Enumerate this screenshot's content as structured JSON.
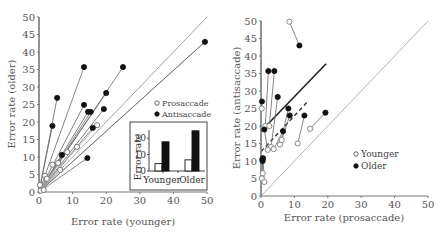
{
  "chart_data": [
    {
      "type": "scatter",
      "title": "",
      "xlabel": "Error rate (younger)",
      "ylabel": "Error rate (older)",
      "xlim": [
        0,
        50
      ],
      "ylim": [
        0,
        50
      ],
      "xticks": [
        "0",
        "10",
        "20",
        "30",
        "40",
        "50"
      ],
      "yticks": [
        "0",
        "5",
        "10",
        "15",
        "20",
        "25",
        "30",
        "35",
        "40",
        "45",
        "50"
      ],
      "grid": false,
      "legend": {
        "placement": "right-middle",
        "entries": [
          "Prosaccade",
          "Antisaccade"
        ]
      },
      "series": [
        {
          "name": "Prosaccade",
          "marker": "open-circle",
          "points": [
            {
              "x": 17.3,
              "y": 19.1
            },
            {
              "x": 11.3,
              "y": 12.9
            },
            {
              "x": 8.4,
              "y": 11.4
            },
            {
              "x": 5.7,
              "y": 8.3
            },
            {
              "x": 4.0,
              "y": 7.8
            },
            {
              "x": 6.3,
              "y": 6.3
            },
            {
              "x": 1.8,
              "y": 4.6
            },
            {
              "x": 2.3,
              "y": 3.8
            },
            {
              "x": 0.3,
              "y": 2.0
            },
            {
              "x": 0.5,
              "y": 0.4
            },
            {
              "x": 1.4,
              "y": 0.6
            }
          ]
        },
        {
          "name": "Antisaccade",
          "marker": "filled-circle",
          "points": [
            {
              "x": 5.4,
              "y": 26.9
            },
            {
              "x": 13.4,
              "y": 35.7
            },
            {
              "x": 25.0,
              "y": 35.7
            },
            {
              "x": 20.0,
              "y": 28.3
            },
            {
              "x": 13.4,
              "y": 24.9
            },
            {
              "x": 14.6,
              "y": 22.9
            },
            {
              "x": 15.4,
              "y": 22.9
            },
            {
              "x": 19.3,
              "y": 23.7
            },
            {
              "x": 49.4,
              "y": 42.9
            },
            {
              "x": 4.0,
              "y": 18.9
            },
            {
              "x": 16.0,
              "y": 18.3
            },
            {
              "x": 6.8,
              "y": 10.6
            },
            {
              "x": 14.4,
              "y": 9.7
            }
          ]
        }
      ],
      "rays_from_origin_to_antisaccade": true,
      "reference_lines": [
        {
          "name": "identity",
          "from": [
            0,
            0
          ],
          "to": [
            50,
            50
          ]
        },
        {
          "name": "fit",
          "from": [
            0,
            0
          ],
          "to": [
            49.4,
            42.9
          ]
        }
      ],
      "inset": {
        "type": "bar",
        "ylabel": "Error rate",
        "categories": [
          "Younger",
          "Older"
        ],
        "yticks": [
          "0",
          "10",
          "20"
        ],
        "ylim": [
          0,
          25
        ],
        "series": [
          {
            "name": "Prosaccade",
            "fill": "#ffffff",
            "values": [
              4.5,
              6.8
            ]
          },
          {
            "name": "Antisaccade",
            "fill": "#111111",
            "values": [
              17.8,
              24.5
            ]
          }
        ]
      }
    },
    {
      "type": "scatter",
      "title": "",
      "xlabel": "Error rate (prosaccade)",
      "ylabel": "Error rate (antisaccade)",
      "xlim": [
        0,
        50
      ],
      "ylim": [
        0,
        50
      ],
      "xticks": [
        "0",
        "10",
        "20",
        "30",
        "40",
        "50"
      ],
      "yticks": [
        "0",
        "5",
        "10",
        "15",
        "20",
        "25",
        "30",
        "35",
        "40",
        "45",
        "50"
      ],
      "grid": false,
      "legend": {
        "placement": "right-middle",
        "entries": [
          "Younger",
          "Older"
        ]
      },
      "pairs": [
        {
          "younger": {
            "x": 8.5,
            "y": 49.8
          },
          "older": {
            "x": 11.5,
            "y": 43.0
          }
        },
        {
          "younger": {
            "x": 0.2,
            "y": 25.0
          },
          "older": {
            "x": 0.3,
            "y": 27.0
          }
        },
        {
          "younger": {
            "x": 1.3,
            "y": 20.0
          },
          "older": {
            "x": 2.2,
            "y": 35.7
          }
        },
        {
          "younger": {
            "x": 2.5,
            "y": 20.0
          },
          "older": {
            "x": 4.0,
            "y": 35.7
          }
        },
        {
          "younger": {
            "x": 3.0,
            "y": 14.0
          },
          "older": {
            "x": 5.0,
            "y": 28.3
          }
        },
        {
          "younger": {
            "x": 5.7,
            "y": 14.7
          },
          "older": {
            "x": 8.2,
            "y": 25.0
          }
        },
        {
          "younger": {
            "x": 6.2,
            "y": 16.0
          },
          "older": {
            "x": 8.6,
            "y": 23.0
          }
        },
        {
          "younger": {
            "x": 11.0,
            "y": 15.0
          },
          "older": {
            "x": 13.0,
            "y": 23.0
          }
        },
        {
          "younger": {
            "x": 14.7,
            "y": 19.2
          },
          "older": {
            "x": 19.3,
            "y": 23.8
          }
        },
        {
          "younger": {
            "x": 3.8,
            "y": 13.4
          },
          "older": {
            "x": 6.6,
            "y": 18.5
          }
        },
        {
          "younger": {
            "x": 2.0,
            "y": 13.2
          },
          "older": {
            "x": 1.0,
            "y": 19.0
          }
        },
        {
          "younger": {
            "x": 0.5,
            "y": 6.5
          },
          "older": {
            "x": 0.4,
            "y": 10.5
          }
        },
        {
          "younger": {
            "x": 0.2,
            "y": 5.0
          },
          "older": {
            "x": 0.5,
            "y": 10.0
          }
        },
        {
          "younger": {
            "x": 1.0,
            "y": 4.0
          },
          "older": {
            "x": 0.6,
            "y": 10.8
          }
        }
      ],
      "reference_lines": [
        {
          "name": "identity",
          "style": "thin-gray",
          "from": [
            0,
            0
          ],
          "to": [
            50,
            50
          ]
        },
        {
          "name": "older-fit",
          "style": "solid-dark",
          "from": [
            0,
            18.5
          ],
          "to": [
            19.5,
            37.8
          ]
        },
        {
          "name": "younger-fit",
          "style": "dashed-dark",
          "from": [
            0,
            12.7
          ],
          "to": [
            14.0,
            27.0
          ]
        }
      ]
    }
  ]
}
